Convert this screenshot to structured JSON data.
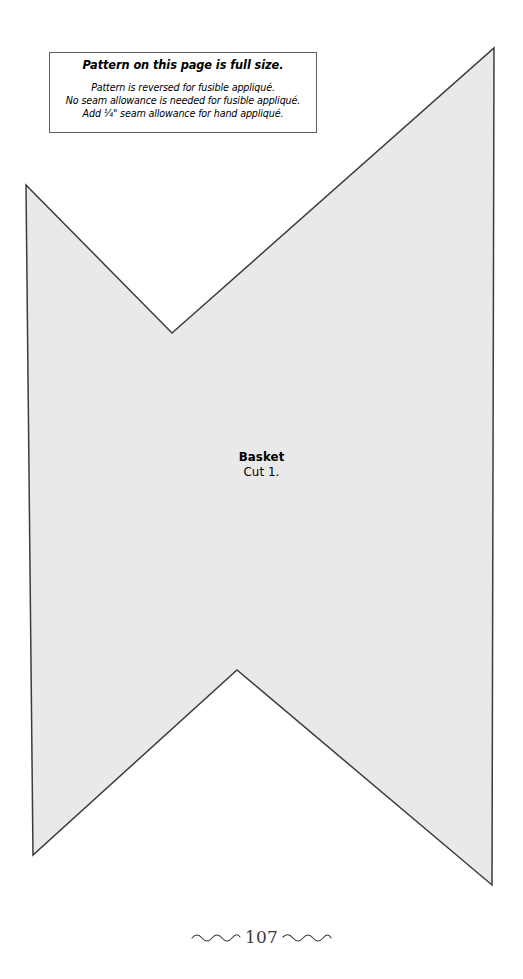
{
  "page": {
    "width": 523,
    "height": 979,
    "background": "#ffffff"
  },
  "note": {
    "title": "Pattern on this page is full size.",
    "lines": [
      "Pattern is reversed for fusible appliqué.",
      "No seam allowance is needed for fusible appliqué.",
      "Add ¼\" seam allowance for hand appliqué."
    ],
    "border_color": "#5d5d5d",
    "background": "#ffffff"
  },
  "pattern": {
    "name": "Basket",
    "cut_instruction": "Cut 1.",
    "fill_color": "#e9e9e9",
    "outline_color": "#3c3c3c",
    "outline_width": 1.5,
    "shape_type": "hexagon-bowtie",
    "vertices": [
      [
        26,
        185
      ],
      [
        172,
        333
      ],
      [
        494,
        48
      ],
      [
        492,
        885
      ],
      [
        237,
        670
      ],
      [
        33,
        855
      ]
    ]
  },
  "footer": {
    "page_number": "107",
    "left_ornament": "wavy-line-ornament",
    "right_ornament": "wavy-line-ornament",
    "ornament_color": "#3a3a3a"
  }
}
